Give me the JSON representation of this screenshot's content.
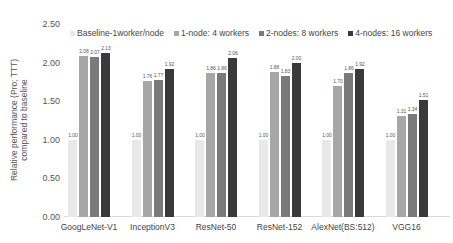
{
  "chart_data": {
    "type": "bar",
    "title": "",
    "xlabel": "",
    "ylabel": "Relative performance (Pro; TTT) compared to baseline",
    "ylabel_lines": [
      "Relative performance (Pro; TTT)",
      "compared to baseline"
    ],
    "ylim": [
      0,
      2.5
    ],
    "yticks": [
      "0.00",
      "0.50",
      "1.00",
      "1.50",
      "2.00",
      "2.50"
    ],
    "grid": false,
    "legend_position": "top",
    "categories": [
      "GoogLeNet-V1",
      "InceptionV3",
      "ResNet-50",
      "ResNet-152",
      "AlexNet(BS:512)",
      "VGG16"
    ],
    "series": [
      {
        "name": "Baseline-1worker/node",
        "color": "#e8e8e8",
        "values": [
          1.0,
          1.0,
          1.0,
          1.0,
          1.0,
          1.0
        ],
        "labels": [
          "1.00",
          "1.00",
          "1.00",
          "1.00",
          "1.00",
          "1.00"
        ]
      },
      {
        "name": "1-node: 4 workers",
        "color": "#a6a6a6",
        "values": [
          2.08,
          1.76,
          1.86,
          1.88,
          1.7,
          1.31
        ],
        "labels": [
          "2.08",
          "1.76",
          "1.86",
          "1.88",
          "1.70",
          "1.31"
        ]
      },
      {
        "name": "2-nodes: 8 workers",
        "color": "#7a7a7a",
        "values": [
          2.07,
          1.77,
          1.86,
          1.83,
          1.86,
          1.34
        ],
        "labels": [
          "2.07",
          "1.77",
          "1.86",
          "1.83",
          "1.86",
          "1.34"
        ]
      },
      {
        "name": "4-nodes: 16 workers",
        "color": "#3a3a3a",
        "values": [
          2.13,
          1.92,
          2.06,
          2.0,
          1.92,
          1.51
        ],
        "labels": [
          "2.13",
          "1.92",
          "2.06",
          "2.00",
          "1.92",
          "1.51"
        ]
      }
    ]
  }
}
